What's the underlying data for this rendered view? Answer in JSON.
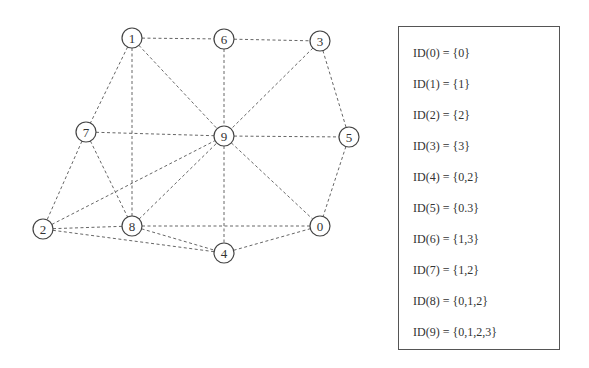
{
  "graph": {
    "node_radius": 10,
    "nodes": [
      {
        "id": "0",
        "x": 320,
        "y": 226
      },
      {
        "id": "1",
        "x": 132,
        "y": 38
      },
      {
        "id": "2",
        "x": 43,
        "y": 229
      },
      {
        "id": "3",
        "x": 320,
        "y": 41
      },
      {
        "id": "4",
        "x": 224,
        "y": 253
      },
      {
        "id": "5",
        "x": 349,
        "y": 137
      },
      {
        "id": "6",
        "x": 224,
        "y": 39
      },
      {
        "id": "7",
        "x": 86,
        "y": 132
      },
      {
        "id": "8",
        "x": 132,
        "y": 226
      },
      {
        "id": "9",
        "x": 224,
        "y": 136
      }
    ],
    "edges": [
      [
        "1",
        "6"
      ],
      [
        "6",
        "3"
      ],
      [
        "1",
        "7"
      ],
      [
        "1",
        "8"
      ],
      [
        "1",
        "9"
      ],
      [
        "6",
        "9"
      ],
      [
        "3",
        "9"
      ],
      [
        "3",
        "5"
      ],
      [
        "7",
        "9"
      ],
      [
        "9",
        "5"
      ],
      [
        "9",
        "0"
      ],
      [
        "5",
        "0"
      ],
      [
        "7",
        "2"
      ],
      [
        "7",
        "8"
      ],
      [
        "2",
        "9"
      ],
      [
        "2",
        "8"
      ],
      [
        "2",
        "4"
      ],
      [
        "8",
        "9"
      ],
      [
        "8",
        "0"
      ],
      [
        "8",
        "4"
      ],
      [
        "9",
        "4"
      ],
      [
        "4",
        "0"
      ]
    ],
    "edge_color": "#666666",
    "node_stroke_color": "#444444"
  },
  "id_table": {
    "lines": [
      "ID(0) = {0}",
      "ID(1) = {1}",
      "ID(2) = {2}",
      "ID(3) = {3}",
      "ID(4) = {0,2}",
      "ID(5) = {0.3}",
      "ID(6) = {1,3}",
      "ID(7) = {1,2}",
      "ID(8) = {0,1,2}",
      "ID(9) = {0,1,2,3}"
    ]
  }
}
